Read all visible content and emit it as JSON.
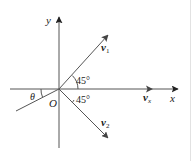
{
  "diagram": {
    "type": "vector-decomposition",
    "colors": {
      "line": "#555555",
      "arrow": "#333333",
      "text": "#222222",
      "border": "#e2e2e2"
    },
    "origin": {
      "label": "O"
    },
    "axes": {
      "x": {
        "label": "x"
      },
      "y": {
        "label": "y"
      }
    },
    "vectors": [
      {
        "id": "v1",
        "base": "v",
        "sub": "1",
        "angle_label": "45°",
        "direction": "up-right"
      },
      {
        "id": "v2",
        "base": "v",
        "sub": "2",
        "angle_label": "45°",
        "direction": "down-right"
      },
      {
        "id": "vx",
        "base": "v",
        "sub": "x",
        "direction": "right"
      }
    ],
    "incline": {
      "angle_label": "θ"
    }
  }
}
